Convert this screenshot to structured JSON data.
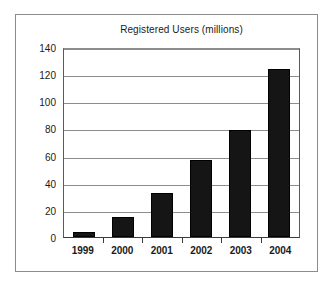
{
  "chart_data": {
    "type": "bar",
    "title": "Registered Users (millions)",
    "xlabel": "",
    "ylabel": "",
    "categories": [
      "1999",
      "2000",
      "2001",
      "2002",
      "2003",
      "2004"
    ],
    "values": [
      4,
      15,
      33,
      57,
      80,
      125
    ],
    "ylim": [
      0,
      140
    ],
    "yticks": [
      0,
      20,
      40,
      60,
      80,
      100,
      120,
      140
    ],
    "ytick_labels": [
      "0",
      "20",
      "40",
      "60",
      "80",
      "100",
      "120",
      "140"
    ],
    "grid": "horizontal",
    "legend": "none",
    "bar_color": "#151515",
    "frame_color": "#8c8c8c",
    "text_color": "#1a1a1a"
  }
}
